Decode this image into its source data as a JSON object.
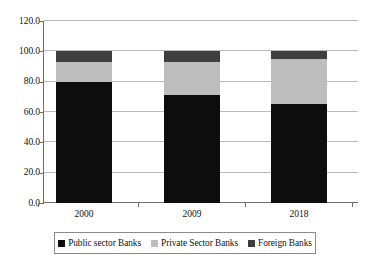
{
  "chart_data": {
    "type": "bar",
    "subtype": "stacked-bar-100",
    "title": "",
    "subtitle": "",
    "xlabel": "",
    "ylabel": "",
    "categories": [
      "2000",
      "2009",
      "2018"
    ],
    "series": [
      {
        "name": "Public sector Banks",
        "color": "#0d0d0d",
        "values": [
          80.0,
          71.5,
          65.5
        ]
      },
      {
        "name": "Private Sector Banks",
        "color": "#bdbdbd",
        "values": [
          13.0,
          21.5,
          29.5
        ]
      },
      {
        "name": "Foreign Banks",
        "color": "#3f3f3f",
        "values": [
          7.0,
          7.0,
          5.0
        ]
      }
    ],
    "ylim": [
      0.0,
      120.0
    ],
    "ytick_values": [
      0.0,
      20.0,
      40.0,
      60.0,
      80.0,
      100.0,
      120.0
    ],
    "ytick_labels": [
      "0.0",
      "20.0",
      "40.0",
      "60.0",
      "80.0",
      "100.0",
      "120.0"
    ],
    "grid": true,
    "grid_axis": "y",
    "legend_position": "bottom",
    "stack_totals": [
      100.0,
      100.0,
      100.0
    ]
  },
  "axes": {
    "y_ticks": [
      {
        "label": "120.0",
        "value": 120.0
      },
      {
        "label": "100.0",
        "value": 100.0
      },
      {
        "label": "80.0",
        "value": 80.0
      },
      {
        "label": "60.0",
        "value": 60.0
      },
      {
        "label": "40.0",
        "value": 40.0
      },
      {
        "label": "20.0",
        "value": 20.0
      },
      {
        "label": "0.0",
        "value": 0.0
      }
    ],
    "x_ticks": [
      {
        "label": "2000"
      },
      {
        "label": "2009"
      },
      {
        "label": "2018"
      }
    ]
  },
  "legend": {
    "items": [
      {
        "label": "Public sector Banks",
        "color": "#0d0d0d"
      },
      {
        "label": "Private Sector Banks",
        "color": "#bdbdbd"
      },
      {
        "label": "Foreign Banks",
        "color": "#3f3f3f"
      }
    ]
  },
  "colors": {
    "public": "#0d0d0d",
    "private": "#bdbdbd",
    "foreign": "#3f3f3f",
    "grid": "#b9b9b9",
    "axis": "#6d6d6d",
    "background": "#ffffff",
    "text": "#111111"
  }
}
